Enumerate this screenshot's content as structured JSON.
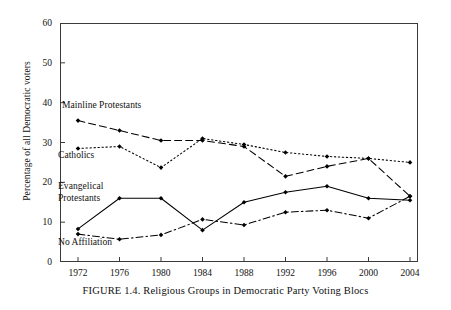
{
  "figure": {
    "caption": "FIGURE 1.4.  Religious Groups in Democratic Party Voting Blocs",
    "ylabel": "Percentage of all Democratic voters"
  },
  "chart_data": {
    "type": "line",
    "title": "",
    "subtitle": "",
    "xlabel": "",
    "ylabel": "Percentage of all Democratic voters",
    "x": [
      1972,
      1976,
      1980,
      1984,
      1988,
      1992,
      1996,
      2000,
      2004
    ],
    "xtick_labels": [
      "1972",
      "1976",
      "1980",
      "1984",
      "1988",
      "1992",
      "1996",
      "2000",
      "2004"
    ],
    "ytick_labels": [
      "0",
      "10",
      "20",
      "30",
      "40",
      "50",
      "60"
    ],
    "yticks": [
      0,
      10,
      20,
      30,
      40,
      50,
      60
    ],
    "xlim": [
      1972,
      2004
    ],
    "ylim": [
      0,
      60
    ],
    "grid": false,
    "legend_position": "inline-annotations",
    "marker": "filled-diamond",
    "series": [
      {
        "name": "Mainline Protestants",
        "linestyle": "dashed",
        "color": "#000000",
        "values": [
          35.5,
          33.0,
          30.5,
          30.5,
          29.0,
          21.5,
          24.0,
          26.0,
          16.5
        ]
      },
      {
        "name": "Catholics",
        "linestyle": "dotted",
        "color": "#000000",
        "values": [
          28.5,
          29.0,
          23.7,
          31.0,
          29.5,
          27.5,
          26.5,
          26.0,
          25.0
        ]
      },
      {
        "name": "Evangelical Protestants",
        "linestyle": "solid",
        "color": "#000000",
        "values": [
          8.3,
          16.0,
          16.0,
          8.0,
          15.0,
          17.5,
          19.0,
          16.0,
          15.5
        ]
      },
      {
        "name": "No Affiliation",
        "linestyle": "dashdot",
        "color": "#000000",
        "values": [
          7.0,
          5.7,
          6.8,
          10.7,
          9.3,
          12.5,
          13.0,
          11.0,
          16.5
        ]
      }
    ],
    "annotations": [
      {
        "text": "Mainline Protestants",
        "series": "Mainline Protestants"
      },
      {
        "text": "Catholics",
        "series": "Catholics"
      },
      {
        "text": "Evangelical\nProtestants",
        "series": "Evangelical Protestants"
      },
      {
        "text": "No Affiliation",
        "series": "No Affiliation"
      }
    ]
  }
}
